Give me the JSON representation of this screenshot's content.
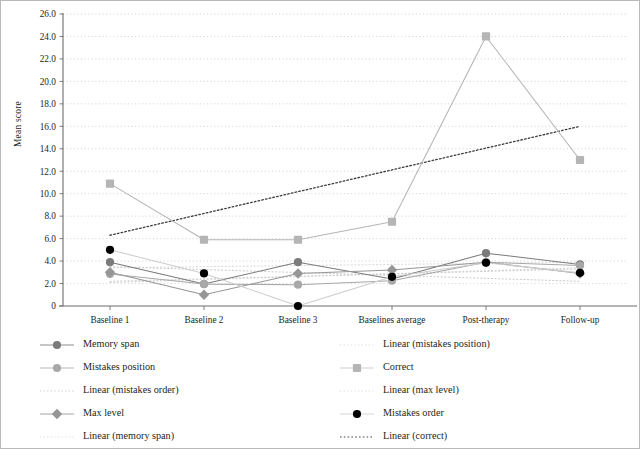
{
  "chart_data": {
    "type": "line",
    "title": "",
    "xlabel": "",
    "ylabel": "Mean score",
    "ylim": [
      0,
      26
    ],
    "ytick_step": 2,
    "grid": true,
    "grid_style": "dotted",
    "legend_position": "bottom",
    "categories": [
      "Baseline 1",
      "Baseline 2",
      "Baseline 3",
      "Baselines average",
      "Post-therapy",
      "Follow-up"
    ],
    "yticks": [
      "0",
      "2.0",
      "4.0",
      "6.0",
      "8.0",
      "10.0",
      "12.0",
      "14.0",
      "16.0",
      "18.0",
      "20.0",
      "22.0",
      "24.0",
      "26.0"
    ],
    "series": [
      {
        "name": "Memory span",
        "marker": "circle",
        "color": "#7b7b7b",
        "line": "solid",
        "values": [
          3.9,
          1.95,
          3.9,
          2.4,
          4.7,
          3.7
        ]
      },
      {
        "name": "Mistakes position",
        "marker": "circle",
        "color": "#a8a8a8",
        "line": "solid",
        "values": [
          2.85,
          1.95,
          1.9,
          2.25,
          3.9,
          3.6
        ]
      },
      {
        "name": "Max level",
        "marker": "diamond",
        "color": "#969696",
        "line": "solid",
        "values": [
          3.0,
          1.0,
          2.9,
          3.2,
          3.9,
          2.9
        ]
      },
      {
        "name": "Mistakes order",
        "marker": "circle",
        "color": "#000000",
        "line": "solid-light",
        "values": [
          5.0,
          2.9,
          0.0,
          2.6,
          3.85,
          2.95
        ]
      },
      {
        "name": "Correct",
        "marker": "square",
        "color": "#b5b5b5",
        "line": "solid",
        "values": [
          10.9,
          5.9,
          5.9,
          7.5,
          24.0,
          13.0
        ]
      }
    ],
    "trendlines": [
      {
        "name": "Linear (memory span)",
        "color": "#d9d9d9",
        "style": "dotted",
        "start": 3.4,
        "end": 3.9
      },
      {
        "name": "Linear (mistakes position)",
        "color": "#d2d2d2",
        "style": "dotted",
        "start": 2.1,
        "end": 3.4
      },
      {
        "name": "Linear (mistakes order)",
        "color": "#c9c9c9",
        "style": "dotted",
        "start": 3.5,
        "end": 2.2
      },
      {
        "name": "Linear (max level)",
        "color": "#cfcfcf",
        "style": "dotted",
        "start": 2.2,
        "end": 3.3
      },
      {
        "name": "Linear (correct)",
        "color": "#3a3a3a",
        "style": "dotted",
        "start": 6.3,
        "end": 16.0
      }
    ]
  },
  "legend": {
    "column1": [
      {
        "label": "Memory span",
        "key": "line-circle-dark"
      },
      {
        "label": "Mistakes position",
        "key": "line-circle-light"
      },
      {
        "label": "Linear (mistakes order)",
        "key": "dotted-line"
      },
      {
        "label": "Max level",
        "key": "line-diamond"
      },
      {
        "label": "Linear (memory span)",
        "key": "dotted-line-pale"
      }
    ],
    "column2": [
      {
        "label": "Linear (mistakes position)",
        "key": "dotted-line-pale"
      },
      {
        "label": "Correct",
        "key": "line-square"
      },
      {
        "label": "Linear (max level)",
        "key": "dotted-line-pale"
      },
      {
        "label": "Mistakes order",
        "key": "black-circle"
      },
      {
        "label": "Linear (correct)",
        "key": "dotted-line-dark"
      }
    ]
  },
  "colors": {
    "axis": "#6d6d6d",
    "grid": "#c6b8b8",
    "text": "#231f20",
    "border": "#b9b9b9"
  }
}
